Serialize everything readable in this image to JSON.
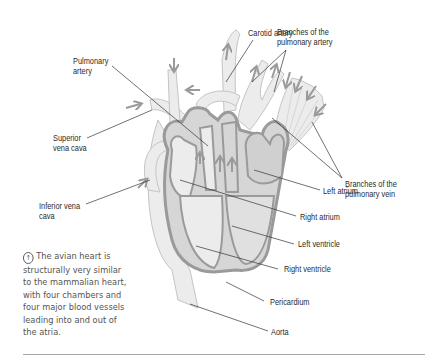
{
  "figure": {
    "colors": {
      "vessel_fill": "#ececec",
      "chamber_fill": "#d6d6d6",
      "wall_stroke": "#9a9a9a",
      "leader_line": "#333333",
      "arrow": "#9a9a9a",
      "rule": "#a8a8a8"
    }
  },
  "labels": {
    "carotid_artery": "Carotid artery",
    "branches_pulmonary_artery": "Branches of the\npulmonary artery",
    "pulmonary_artery": "Pulmonary\nartery",
    "superior_vena_cava": "Superior\nvena cava",
    "branches_pulmonary_vein": "Branches of the\npulmonary vein",
    "inferior_vena_cava": "Inferior vena\ncava",
    "left_atrium": "Left atrium",
    "right_atrium": "Right atrium",
    "left_ventricle": "Left ventricle",
    "right_ventricle": "Right ventricle",
    "pericardium": "Pericardium",
    "aorta": "Aorta"
  },
  "caption": {
    "icon": "arrow-circle-icon",
    "icon_glyph": "↑",
    "text": "The avian heart is structurally very similar to the mammalian heart, with four chambers and four major blood vessels leading into and out of the atria."
  }
}
